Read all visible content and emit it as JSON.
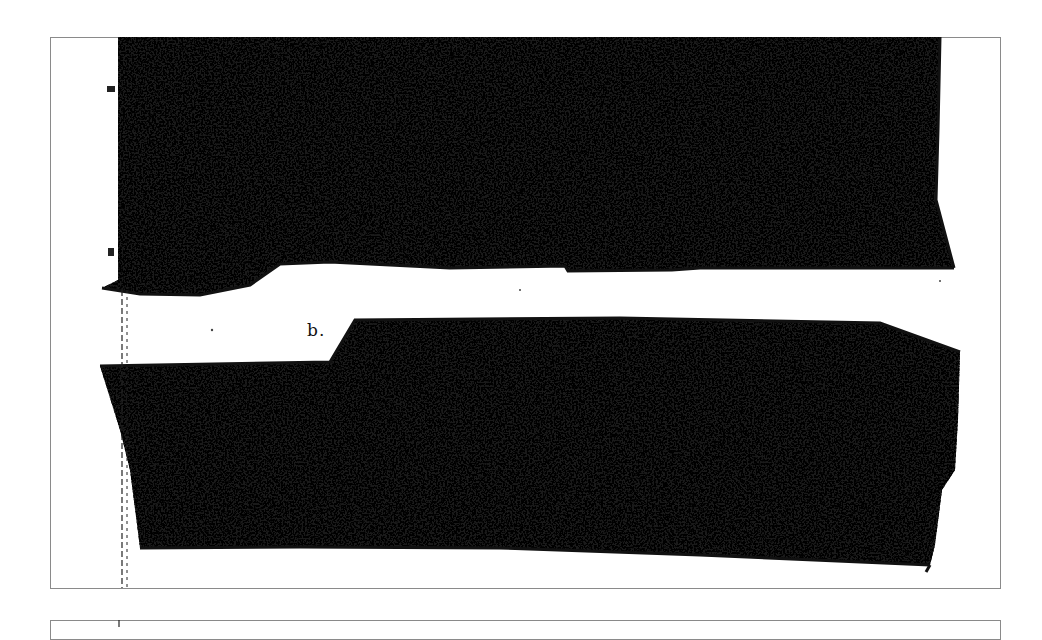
{
  "document": {
    "type": "scanned figure page",
    "panel_label": "b.",
    "colors": {
      "ink": "#111111",
      "paper": "#ffffff",
      "frame_border": "#8a8a8a"
    },
    "frames": [
      {
        "id": "figure-frame",
        "x": 50,
        "y": 37,
        "width": 951,
        "height": 552
      },
      {
        "id": "next-figure-frame",
        "x": 50,
        "y": 620,
        "width": 951,
        "height": 20
      }
    ],
    "regions": [
      {
        "id": "upper-stippled-mass",
        "description": "dark stippled band, top of figure"
      },
      {
        "id": "lower-stippled-mass",
        "description": "dark stippled band, bottom of figure"
      }
    ]
  }
}
